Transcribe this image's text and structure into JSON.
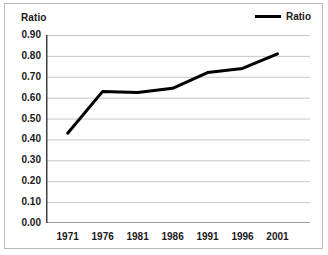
{
  "chart_data": {
    "type": "line",
    "title": "",
    "xlabel": "",
    "ylabel": "Ratio",
    "categories": [
      "1971",
      "1976",
      "1981",
      "1986",
      "1991",
      "1996",
      "2001"
    ],
    "series": [
      {
        "name": "Ratio",
        "color": "#000000",
        "values": [
          0.43,
          0.63,
          0.625,
          0.645,
          0.72,
          0.74,
          0.81
        ]
      }
    ],
    "ylim": [
      0.0,
      0.9
    ],
    "ytick_labels": [
      "0.00",
      "0.10",
      "0.20",
      "0.30",
      "0.40",
      "0.50",
      "0.60",
      "0.70",
      "0.80",
      "0.90"
    ],
    "ytick_values": [
      0.0,
      0.1,
      0.2,
      0.3,
      0.4,
      0.5,
      0.6,
      0.7,
      0.8,
      0.9
    ],
    "grid": true,
    "grid_color": "#c8c8c8",
    "axis_color": "#404040",
    "legend_position": "top-right",
    "legend": [
      {
        "label": "Ratio",
        "color": "#000000"
      }
    ]
  },
  "legend_label": "Ratio",
  "y_axis_title": "Ratio"
}
